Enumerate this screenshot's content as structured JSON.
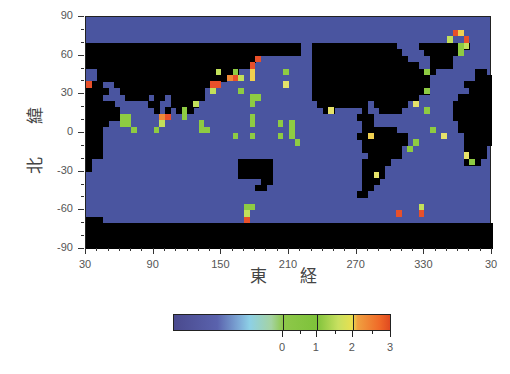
{
  "chart_data": {
    "type": "heatmap",
    "title": "",
    "xlabel": "東 経",
    "ylabel": "北 緯",
    "xlim": [
      30,
      390
    ],
    "ylim": [
      -90,
      90
    ],
    "x_tick_labels": [
      "30",
      "90",
      "150",
      "210",
      "270",
      "330",
      "30"
    ],
    "x_tick_values": [
      30,
      90,
      150,
      210,
      270,
      330,
      390
    ],
    "y_tick_labels": [
      "90",
      "60",
      "30",
      "0",
      "-30",
      "-60",
      "-90"
    ],
    "y_tick_values": [
      90,
      60,
      30,
      0,
      -30,
      -60,
      -90
    ],
    "grid_resolution_deg": 5,
    "land_color": "#000000",
    "ocean_background_color": "#4a55a0",
    "colorbar": {
      "tick_labels": [
        "0",
        "1",
        "2",
        "3"
      ],
      "tick_values": [
        0,
        1,
        2,
        3
      ],
      "colors": [
        "#4a4a8e",
        "#7da9d6",
        "#8ec84a",
        "#c8e060",
        "#e8e050",
        "#f06a28"
      ]
    },
    "land_mask_rows": [
      "........................................................................",
      "........................................................................",
      "........................................................................",
      "........................................................................",
      "######################################..###############....#########...",
      "######################################..################....######.....",
      "##############################..........#################....####......",
      "#############################...........###################..####......",
      "..#########################.............######################.......##",
      "..#######################...............#####################........###",
      "###..#################..................#####################......#####",
      "####..###############...................#####################.......####",
      "###....####.##.######...................###################.......######",
      "#####......##..#####.....................#########.######........#######",
      "######......#.#.###.......................##.....#..####.........#######",
      "######..........................................###..............#######",
      "####.............................................##...............######",
      "###..............................................######...........######",
      "###.............................................#########..........#####",
      "###..............................................########..........#####",
      "###..............................................#######...........####.",
      "###...............................................######............###.",
      "#..........................######................#####.............###.",
      "#..........................######................####...................",
      "...........................######................####..................",
      "...............................##................###...................",
      "..............................##.................##....................",
      "................................................##.....................",
      "........................................................................",
      "........................................................................",
      "........................................................................",
      "###.....................................................................",
      "########################################################################",
      "########################################################################",
      "########################################################################",
      "########################################################################"
    ],
    "points": [
      {
        "lon": 30,
        "lat": 40,
        "value": 2.8
      },
      {
        "lon": 60,
        "lat": 15,
        "value": 0.6
      },
      {
        "lon": 60,
        "lat": 10,
        "value": 0.5
      },
      {
        "lon": 65,
        "lat": 15,
        "value": 0.7
      },
      {
        "lon": 65,
        "lat": 10,
        "value": 0.4
      },
      {
        "lon": 70,
        "lat": 5,
        "value": 0.3
      },
      {
        "lon": 95,
        "lat": 15,
        "value": 2.1
      },
      {
        "lon": 100,
        "lat": 15,
        "value": 2.6
      },
      {
        "lon": 95,
        "lat": 10,
        "value": 0.8
      },
      {
        "lon": 90,
        "lat": 5,
        "value": 0.4
      },
      {
        "lon": 115,
        "lat": 20,
        "value": 0.6
      },
      {
        "lon": 115,
        "lat": 15,
        "value": 0.5
      },
      {
        "lon": 125,
        "lat": 25,
        "value": 0.8
      },
      {
        "lon": 140,
        "lat": 40,
        "value": 2.9
      },
      {
        "lon": 145,
        "lat": 40,
        "value": 2.7
      },
      {
        "lon": 140,
        "lat": 35,
        "value": 0.9
      },
      {
        "lon": 145,
        "lat": 50,
        "value": 0.9
      },
      {
        "lon": 155,
        "lat": 45,
        "value": 2.2
      },
      {
        "lon": 160,
        "lat": 45,
        "value": 2.8
      },
      {
        "lon": 160,
        "lat": 50,
        "value": 0.7
      },
      {
        "lon": 165,
        "lat": 45,
        "value": 0.8
      },
      {
        "lon": 165,
        "lat": 35,
        "value": 0.7
      },
      {
        "lon": 175,
        "lat": 55,
        "value": 2.6
      },
      {
        "lon": 175,
        "lat": 50,
        "value": 1.9
      },
      {
        "lon": 175,
        "lat": 45,
        "value": 1.8
      },
      {
        "lon": 180,
        "lat": 60,
        "value": 2.8
      },
      {
        "lon": 175,
        "lat": 30,
        "value": 0.5
      },
      {
        "lon": 180,
        "lat": 30,
        "value": 0.6
      },
      {
        "lon": 175,
        "lat": 25,
        "value": 0.5
      },
      {
        "lon": 175,
        "lat": 15,
        "value": 0.4
      },
      {
        "lon": 175,
        "lat": 10,
        "value": 0.4
      },
      {
        "lon": 130,
        "lat": 10,
        "value": 0.5
      },
      {
        "lon": 130,
        "lat": 5,
        "value": 0.6
      },
      {
        "lon": 135,
        "lat": 5,
        "value": 0.6
      },
      {
        "lon": 160,
        "lat": 0,
        "value": 0.5
      },
      {
        "lon": 175,
        "lat": 0,
        "value": 0.4
      },
      {
        "lon": 205,
        "lat": 50,
        "value": 0.6
      },
      {
        "lon": 205,
        "lat": 40,
        "value": 1.2
      },
      {
        "lon": 200,
        "lat": 10,
        "value": 0.5
      },
      {
        "lon": 200,
        "lat": 0,
        "value": 0.5
      },
      {
        "lon": 210,
        "lat": 10,
        "value": 0.6
      },
      {
        "lon": 210,
        "lat": 5,
        "value": 0.6
      },
      {
        "lon": 210,
        "lat": 0,
        "value": 0.6
      },
      {
        "lon": 215,
        "lat": -5,
        "value": 0.5
      },
      {
        "lon": 280,
        "lat": 0,
        "value": 1.8
      },
      {
        "lon": 285,
        "lat": -30,
        "value": 1.4
      },
      {
        "lon": 245,
        "lat": 20,
        "value": 1.5
      },
      {
        "lon": 320,
        "lat": 25,
        "value": 1.5
      },
      {
        "lon": 330,
        "lat": 50,
        "value": 0.5
      },
      {
        "lon": 330,
        "lat": 35,
        "value": 0.5
      },
      {
        "lon": 330,
        "lat": 20,
        "value": 0.6
      },
      {
        "lon": 335,
        "lat": 5,
        "value": 0.7
      },
      {
        "lon": 345,
        "lat": 0,
        "value": 1.5
      },
      {
        "lon": 320,
        "lat": -5,
        "value": 0.5
      },
      {
        "lon": 315,
        "lat": -10,
        "value": 0.4
      },
      {
        "lon": 365,
        "lat": -15,
        "value": 1.4
      },
      {
        "lon": 370,
        "lat": -20,
        "value": 0.5
      },
      {
        "lon": 355,
        "lat": 80,
        "value": 2.8
      },
      {
        "lon": 360,
        "lat": 80,
        "value": 1.9
      },
      {
        "lon": 365,
        "lat": 75,
        "value": 2.7
      },
      {
        "lon": 350,
        "lat": 75,
        "value": 0.8
      },
      {
        "lon": 360,
        "lat": 70,
        "value": 0.4
      },
      {
        "lon": 360,
        "lat": 65,
        "value": 0.4
      },
      {
        "lon": 365,
        "lat": 70,
        "value": 0.9
      },
      {
        "lon": 305,
        "lat": -60,
        "value": 2.8
      },
      {
        "lon": 325,
        "lat": -60,
        "value": 2.7
      },
      {
        "lon": 325,
        "lat": -55,
        "value": 0.8
      },
      {
        "lon": 170,
        "lat": -55,
        "value": 0.7
      },
      {
        "lon": 175,
        "lat": -55,
        "value": 0.7
      },
      {
        "lon": 170,
        "lat": -60,
        "value": 0.8
      },
      {
        "lon": 170,
        "lat": -65,
        "value": 2.8
      }
    ]
  }
}
